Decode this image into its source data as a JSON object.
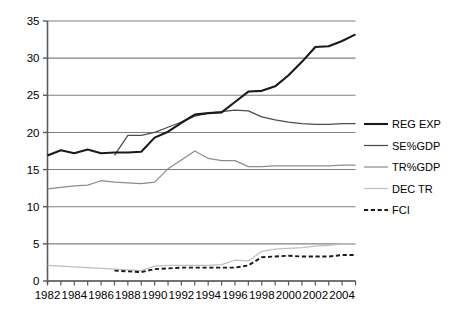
{
  "chart_data": {
    "type": "line",
    "title": "",
    "xlabel": "",
    "ylabel": "",
    "xlim": [
      1982,
      2005
    ],
    "ylim": [
      0,
      35
    ],
    "yticks": [
      0,
      5,
      10,
      15,
      20,
      25,
      30,
      35
    ],
    "ytick_labels": [
      "0",
      "5",
      "10",
      "15",
      "20",
      "25",
      "30",
      "35"
    ],
    "xticks": [
      1982,
      1983,
      1984,
      1985,
      1986,
      1987,
      1988,
      1989,
      1990,
      1991,
      1992,
      1993,
      1994,
      1995,
      1996,
      1997,
      1998,
      1999,
      2000,
      2001,
      2002,
      2003,
      2004,
      2005
    ],
    "xtick_labels": [
      "1982",
      "1984",
      "1986",
      "1988",
      "1990",
      "1992",
      "1994",
      "1996",
      "1998",
      "2000",
      "2002",
      "2004"
    ],
    "xtick_labelled_years": [
      1982,
      1984,
      1986,
      1988,
      1990,
      1992,
      1994,
      1996,
      1998,
      2000,
      2002,
      2004
    ],
    "grid": "horizontal",
    "legend_position": "right",
    "series": [
      {
        "name": "REG EXP",
        "color": "#1a1a1a",
        "style": "solid",
        "width": 2.1,
        "x": [
          1982,
          1983,
          1984,
          1985,
          1986,
          1987,
          1988,
          1989,
          1990,
          1991,
          1992,
          1993,
          1994,
          1995,
          1996,
          1997,
          1998,
          1999,
          2000,
          2001,
          2002,
          2003,
          2004,
          2005
        ],
        "values": [
          16.9,
          17.6,
          17.2,
          17.7,
          17.2,
          17.3,
          17.3,
          17.4,
          19.3,
          20.1,
          21.3,
          22.4,
          22.6,
          22.7,
          24.1,
          25.5,
          25.6,
          26.2,
          27.7,
          29.5,
          31.5,
          31.6,
          32.3,
          33.2
        ]
      },
      {
        "name": "SE%GDP",
        "color": "#4d4d4d",
        "style": "solid",
        "width": 1.25,
        "x": [
          1987,
          1988,
          1989,
          1990,
          1991,
          1992,
          1993,
          1994,
          1995,
          1996,
          1997,
          1998,
          1999,
          2000,
          2001,
          2002,
          2003,
          2004,
          2005
        ],
        "values": [
          16.9,
          19.6,
          19.6,
          20.0,
          20.7,
          21.4,
          22.2,
          22.6,
          22.8,
          23.0,
          22.9,
          22.1,
          21.7,
          21.4,
          21.2,
          21.1,
          21.1,
          21.2,
          21.2
        ]
      },
      {
        "name": "TR%GDP",
        "color": "#8c8c8c",
        "style": "solid",
        "width": 1.2,
        "x": [
          1982,
          1983,
          1984,
          1985,
          1986,
          1987,
          1988,
          1989,
          1990,
          1991,
          1992,
          1993,
          1994,
          1995,
          1996,
          1997,
          1998,
          1999,
          2000,
          2001,
          2002,
          2003,
          2004,
          2005
        ],
        "values": [
          12.4,
          12.6,
          12.8,
          12.9,
          13.5,
          13.3,
          13.2,
          13.1,
          13.3,
          15.1,
          16.3,
          17.5,
          16.5,
          16.2,
          16.2,
          15.4,
          15.4,
          15.5,
          15.5,
          15.5,
          15.5,
          15.5,
          15.6,
          15.6
        ]
      },
      {
        "name": "DEC TR",
        "color": "#bfbfbf",
        "style": "solid",
        "width": 1.2,
        "x": [
          1982,
          1983,
          1984,
          1985,
          1986,
          1987,
          1988,
          1989,
          1990,
          1991,
          1992,
          1993,
          1994,
          1995,
          1996,
          1997,
          1998,
          1999,
          2000,
          2001,
          2002,
          2003,
          2004,
          2005
        ],
        "values": [
          2.1,
          2.0,
          1.9,
          1.8,
          1.7,
          1.6,
          1.5,
          1.4,
          2.0,
          2.1,
          2.1,
          2.1,
          2.1,
          2.2,
          2.8,
          2.7,
          4.0,
          4.3,
          4.4,
          4.5,
          4.7,
          4.8,
          5.0,
          5.0
        ]
      },
      {
        "name": "FCI",
        "color": "#1a1a1a",
        "style": "dashed",
        "width": 1.9,
        "x": [
          1987,
          1988,
          1989,
          1990,
          1991,
          1992,
          1993,
          1994,
          1995,
          1996,
          1997,
          1998,
          1999,
          2000,
          2001,
          2002,
          2003,
          2004,
          2005
        ],
        "values": [
          1.4,
          1.3,
          1.2,
          1.6,
          1.7,
          1.8,
          1.8,
          1.8,
          1.8,
          1.8,
          2.1,
          3.2,
          3.3,
          3.4,
          3.3,
          3.3,
          3.3,
          3.5,
          3.5
        ]
      }
    ]
  },
  "legend": {
    "entries": [
      {
        "label": "REG EXP"
      },
      {
        "label": "SE%GDP"
      },
      {
        "label": "TR%GDP"
      },
      {
        "label": "DEC TR"
      },
      {
        "label": "FCI"
      }
    ]
  },
  "axes": {
    "gridline_color": "#808080",
    "axis_color": "#666666"
  }
}
